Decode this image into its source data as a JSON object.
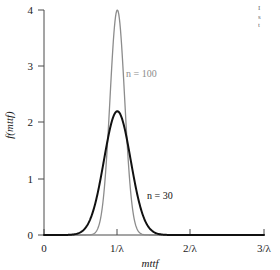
{
  "chart_data": {
    "type": "line",
    "title": "",
    "xlabel": "mttf",
    "ylabel": "f(mttf)",
    "xlim": [
      0,
      3
    ],
    "ylim": [
      0,
      4
    ],
    "grid": false,
    "legend_position": "inline-annotation",
    "x_tick_labels": [
      "0",
      "1/λ",
      "2/λ",
      "3/λ"
    ],
    "x_tick_values": [
      0,
      1,
      2,
      3
    ],
    "y_tick_labels": [
      "0",
      "1",
      "2",
      "3",
      "4"
    ],
    "y_tick_values": [
      0,
      1,
      2,
      3,
      4
    ],
    "series": [
      {
        "name": "n = 100",
        "color": "#8c8c8c",
        "peak_x": 1.0,
        "peak_y": 4.0,
        "sigma": 0.1,
        "x": [
          0.55,
          0.6,
          0.65,
          0.7,
          0.75,
          0.8,
          0.85,
          0.9,
          0.95,
          1.0,
          1.05,
          1.1,
          1.15,
          1.2,
          1.25,
          1.3,
          1.35,
          1.4,
          1.45
        ],
        "values": [
          0.0,
          0.01,
          0.05,
          0.17,
          0.44,
          0.9,
          1.8,
          2.9,
          3.72,
          4.0,
          3.72,
          2.9,
          1.8,
          0.9,
          0.44,
          0.17,
          0.05,
          0.01,
          0.0
        ]
      },
      {
        "name": "n = 30",
        "color": "#111111",
        "peak_x": 1.0,
        "peak_y": 2.2,
        "sigma": 0.182,
        "x": [
          0.35,
          0.42,
          0.5,
          0.55,
          0.6,
          0.65,
          0.7,
          0.75,
          0.8,
          0.85,
          0.9,
          0.95,
          1.0,
          1.05,
          1.1,
          1.15,
          1.2,
          1.25,
          1.3,
          1.35,
          1.4,
          1.45,
          1.5,
          1.58,
          1.65
        ],
        "values": [
          0.01,
          0.04,
          0.12,
          0.22,
          0.37,
          0.58,
          0.85,
          1.15,
          1.48,
          1.78,
          2.02,
          2.16,
          2.2,
          2.16,
          2.02,
          1.78,
          1.48,
          1.15,
          0.85,
          0.58,
          0.37,
          0.22,
          0.12,
          0.04,
          0.01
        ]
      }
    ],
    "annotations": [
      {
        "text": "n = 100",
        "x": 1.12,
        "y": 3.05,
        "color": "#8c8c8c"
      },
      {
        "text": "n = 30",
        "x": 1.5,
        "y": 0.82,
        "color": "#111111"
      }
    ]
  },
  "caption": {
    "line1": "I",
    "line2": "s",
    "line3": "t"
  }
}
